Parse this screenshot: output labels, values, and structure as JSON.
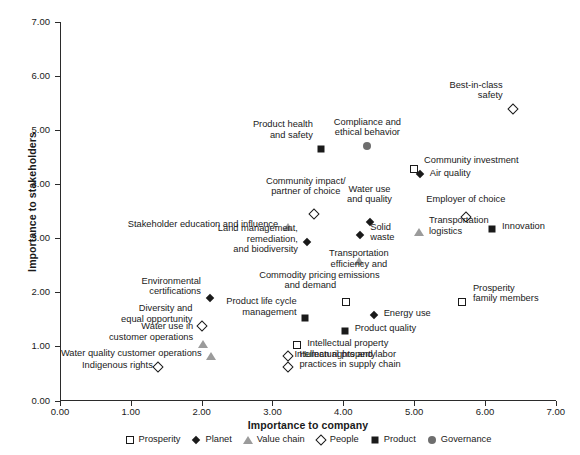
{
  "chart_data": {
    "type": "scatter",
    "title": "",
    "xlabel": "Importance to company",
    "ylabel": "Importance to stakeholders",
    "xlim": [
      0.0,
      7.0
    ],
    "ylim": [
      0.0,
      7.0
    ],
    "xticks": [
      "0.00",
      "1.00",
      "2.00",
      "3.00",
      "4.00",
      "5.00",
      "6.00",
      "7.00"
    ],
    "yticks": [
      "0.00",
      "1.00",
      "2.00",
      "3.00",
      "4.00",
      "5.00",
      "6.00",
      "7.00"
    ],
    "grid": false,
    "legend_position": "bottom",
    "series": [
      {
        "name": "Prosperity",
        "marker": "open-square",
        "color": "#1a1a1a"
      },
      {
        "name": "Planet",
        "marker": "filled-diamond",
        "color": "#1a1a1a"
      },
      {
        "name": "Value chain",
        "marker": "gray-triangle",
        "color": "#9b9b9b"
      },
      {
        "name": "People",
        "marker": "open-diamond",
        "color": "#1a1a1a"
      },
      {
        "name": "Product",
        "marker": "filled-square",
        "color": "#1a1a1a"
      },
      {
        "name": "Governance",
        "marker": "gray-circle",
        "color": "#6e6e6e"
      }
    ],
    "points": [
      {
        "label": "Best-in-class\nsafety",
        "series": "People",
        "x": 6.39,
        "y": 5.39,
        "lx": 6.25,
        "ly": 5.74,
        "align": "right"
      },
      {
        "label": "Compliance and\nethical behavior",
        "series": "Governance",
        "x": 4.34,
        "y": 4.7,
        "lx": 4.34,
        "ly": 5.05,
        "align": "center"
      },
      {
        "label": "Product health\nand safety",
        "series": "Product",
        "x": 3.69,
        "y": 4.66,
        "lx": 3.57,
        "ly": 5.01,
        "align": "right"
      },
      {
        "label": "Community investment",
        "series": "Prosperity",
        "x": 5.0,
        "y": 4.29,
        "lx": 5.14,
        "ly": 4.45,
        "align": "left"
      },
      {
        "label": "Air quality",
        "series": "Planet",
        "x": 5.08,
        "y": 4.18,
        "lx": 5.22,
        "ly": 4.2,
        "align": "left"
      },
      {
        "label": "Community impact/\npartner of choice",
        "series": "People",
        "x": 3.59,
        "y": 3.45,
        "lx": 3.47,
        "ly": 3.96,
        "align": "center"
      },
      {
        "label": "Water use\nand quality",
        "series": "Planet",
        "x": 4.37,
        "y": 3.3,
        "lx": 4.37,
        "ly": 3.81,
        "align": "center"
      },
      {
        "label": "Employer of choice",
        "series": "People",
        "x": 5.73,
        "y": 3.39,
        "lx": 5.73,
        "ly": 3.72,
        "align": "center"
      },
      {
        "label": "Stakeholder education and influence",
        "series": "Value chain",
        "x": 3.22,
        "y": 3.21,
        "lx": 3.08,
        "ly": 3.26,
        "align": "right"
      },
      {
        "label": "Innovation",
        "series": "Product",
        "x": 6.1,
        "y": 3.18,
        "lx": 6.24,
        "ly": 3.22,
        "align": "left"
      },
      {
        "label": "Transportation\nlogistics",
        "series": "Value chain",
        "x": 5.07,
        "y": 3.12,
        "lx": 5.21,
        "ly": 3.23,
        "align": "left"
      },
      {
        "label": "Solid\nwaste",
        "series": "Planet",
        "x": 4.24,
        "y": 3.07,
        "lx": 4.38,
        "ly": 3.11,
        "align": "left"
      },
      {
        "label": "Land management,\nremediation,\nand biodiversity",
        "series": "Planet",
        "x": 3.49,
        "y": 2.94,
        "lx": 3.36,
        "ly": 2.99,
        "align": "right"
      },
      {
        "label": "Transportation\nefficiency and\nemissions",
        "series": "Value chain",
        "x": 4.22,
        "y": 2.58,
        "lx": 4.22,
        "ly": 2.52,
        "align": "center"
      },
      {
        "label": "Prosperity\nfamily members",
        "series": "Prosperity",
        "x": 5.67,
        "y": 1.83,
        "lx": 5.83,
        "ly": 1.98,
        "align": "left"
      },
      {
        "label": "Commodity pricing\nand demand",
        "series": "Prosperity",
        "x": 4.04,
        "y": 1.83,
        "lx": 3.9,
        "ly": 2.22,
        "align": "right"
      },
      {
        "label": "Energy use",
        "series": "Planet",
        "x": 4.43,
        "y": 1.59,
        "lx": 4.57,
        "ly": 1.62,
        "align": "left"
      },
      {
        "label": "Environmental\ncertifications",
        "series": "Planet",
        "x": 2.12,
        "y": 1.89,
        "lx": 1.99,
        "ly": 2.11,
        "align": "right"
      },
      {
        "label": "Product life cycle\nmanagement",
        "series": "Product",
        "x": 3.46,
        "y": 1.52,
        "lx": 3.34,
        "ly": 1.73,
        "align": "right"
      },
      {
        "label": "Diversity and\nequal opportunity",
        "series": "People",
        "x": 2.0,
        "y": 1.37,
        "lx": 1.87,
        "ly": 1.6,
        "align": "right"
      },
      {
        "label": "Product quality",
        "series": "Product",
        "x": 4.02,
        "y": 1.29,
        "lx": 4.16,
        "ly": 1.33,
        "align": "left"
      },
      {
        "label": "Water use in\ncustomer operations",
        "series": "Value chain",
        "x": 2.02,
        "y": 1.04,
        "lx": 1.88,
        "ly": 1.27,
        "align": "right"
      },
      {
        "label": "Intellectual property",
        "series": "Prosperity",
        "x": 3.35,
        "y": 1.02,
        "lx": 3.49,
        "ly": 1.05,
        "align": "left"
      },
      {
        "label": "Water quality customer operations",
        "series": "Value chain",
        "x": 2.13,
        "y": 0.83,
        "lx": 2.0,
        "ly": 0.87,
        "align": "right"
      },
      {
        "label": "Intellectual property",
        "series": "People",
        "x": 3.22,
        "y": 0.82,
        "lx": 3.31,
        "ly": 0.85,
        "align": "left"
      },
      {
        "label": "Indigenous rights",
        "series": "People",
        "x": 1.39,
        "y": 0.62,
        "lx": 1.31,
        "ly": 0.65,
        "align": "right"
      },
      {
        "label": "Human rights and labor\npractices in supply chain",
        "series": "People",
        "x": 3.22,
        "y": 0.62,
        "lx": 3.38,
        "ly": 0.76,
        "align": "left"
      }
    ]
  },
  "legend": {
    "items": [
      {
        "label": "Prosperity",
        "glyph": "open-square-icon"
      },
      {
        "label": "Planet",
        "glyph": "filled-diamond-icon"
      },
      {
        "label": "Value chain",
        "glyph": "gray-triangle-icon"
      },
      {
        "label": "People",
        "glyph": "open-diamond-icon"
      },
      {
        "label": "Product",
        "glyph": "filled-square-icon"
      },
      {
        "label": "Governance",
        "glyph": "gray-circle-icon"
      }
    ]
  }
}
